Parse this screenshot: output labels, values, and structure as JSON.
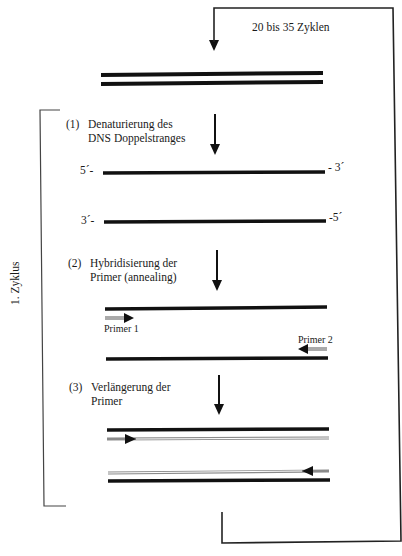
{
  "diagram": {
    "title_loop_label": "20 bis 35 Zyklen",
    "cycle_label": "1. Zyklus",
    "steps": [
      {
        "number": "(1)",
        "line1": "Denaturierung des",
        "line2": "DNS Doppelstranges"
      },
      {
        "number": "(2)",
        "line1": "Hybridisierung der",
        "line2": "Primer (annealing)"
      },
      {
        "number": "(3)",
        "line1": "Verlängerung der",
        "line2": "Primer"
      }
    ],
    "strand_labels": {
      "top_left": "5´-",
      "top_right": "- 3´",
      "bottom_left": "3´-",
      "bottom_right": "-5´"
    },
    "primers": {
      "primer1": "Primer 1",
      "primer2": "Primer 2"
    },
    "colors": {
      "strand": "#111111",
      "new_strand": "#8a8a8a",
      "line": "#222222"
    }
  }
}
